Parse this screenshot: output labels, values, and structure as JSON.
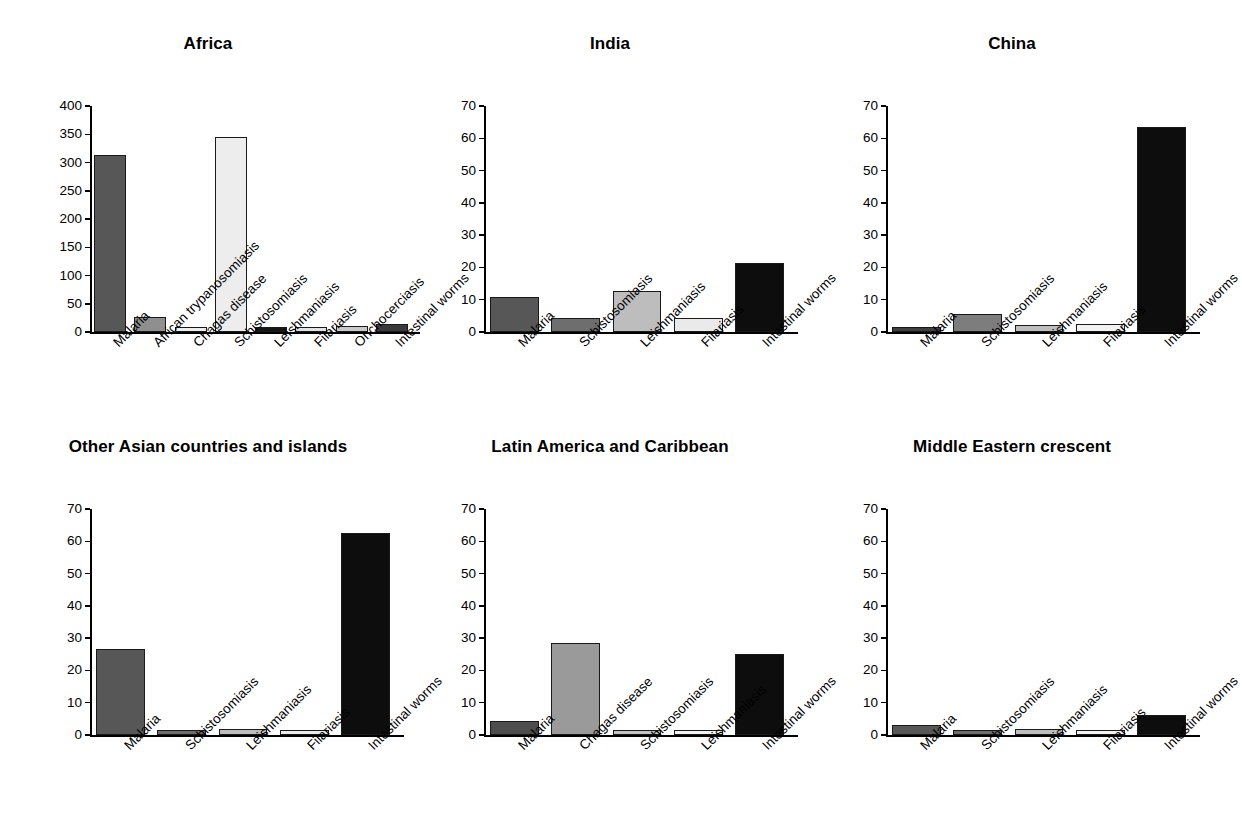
{
  "figure": {
    "background": "#ffffff",
    "panel_count": 6,
    "layout": "2 rows x 3 columns"
  },
  "palette": {
    "malaria": "#575757",
    "african_trypanosomiasis": "#8f8f8f",
    "chagas_disease": "#9a9a9a",
    "schistosomiasis_light": "#ededed",
    "schistosomiasis_medium": "#6e6e6e",
    "leishmaniasis": "#bdbdbd",
    "filariasis": "#eaeaea",
    "onchocerciasis": "#c9c9c9",
    "intestinal_worms": "#0d0d0d",
    "axis": "#000000",
    "bar_outline": "#1a1a1a"
  },
  "chart_data": [
    {
      "type": "bar",
      "title": "Africa",
      "xlabel": "",
      "ylabel": "",
      "ylim": [
        0,
        400
      ],
      "yticks": [
        0,
        50,
        100,
        150,
        200,
        250,
        300,
        350,
        400
      ],
      "grid": false,
      "legend": "none",
      "categories": [
        "Malaria",
        "African trypanosomiasis",
        "Chagas disease",
        "Schistosomiasis",
        "Leishmaniasis",
        "Filariasis",
        "Onchocerciasis",
        "Intestinal worms"
      ],
      "values": [
        313,
        26,
        6,
        346,
        9,
        9,
        11,
        15
      ],
      "colors": [
        "#575757",
        "#8f8f8f",
        "#ededed",
        "#ededed",
        "#161616",
        "#e2e2e2",
        "#c9c9c9",
        "#3a3a3a"
      ]
    },
    {
      "type": "bar",
      "title": "India",
      "xlabel": "",
      "ylabel": "",
      "ylim": [
        0,
        70
      ],
      "yticks": [
        0,
        10,
        20,
        30,
        40,
        50,
        60,
        70
      ],
      "grid": false,
      "legend": "none",
      "categories": [
        "Malaria",
        "Schistosomiasis",
        "Leishmaniasis",
        "Filariasis",
        "Intestinal worms"
      ],
      "values": [
        11.0,
        4.3,
        12.7,
        4.3,
        21.3
      ],
      "colors": [
        "#575757",
        "#6e6e6e",
        "#bdbdbd",
        "#eaeaea",
        "#0d0d0d"
      ]
    },
    {
      "type": "bar",
      "title": "China",
      "xlabel": "",
      "ylabel": "",
      "ylim": [
        0,
        70
      ],
      "yticks": [
        0,
        10,
        20,
        30,
        40,
        50,
        60,
        70
      ],
      "grid": false,
      "legend": "none",
      "categories": [
        "Malaria",
        "Schistosomiasis",
        "Leishmaniasis",
        "Filariasis",
        "Intestinal worms"
      ],
      "values": [
        1.3,
        5.5,
        2.2,
        2.5,
        63.5
      ],
      "colors": [
        "#3f3f3f",
        "#7d7d7d",
        "#bdbdbd",
        "#f2f2f2",
        "#0d0d0d"
      ]
    },
    {
      "type": "bar",
      "title": "Other Asian countries and islands",
      "xlabel": "",
      "ylabel": "",
      "ylim": [
        0,
        70
      ],
      "yticks": [
        0,
        10,
        20,
        30,
        40,
        50,
        60,
        70
      ],
      "grid": false,
      "legend": "none",
      "categories": [
        "Malaria",
        "Schistosomiasis",
        "Leishmaniasis",
        "Filariasis",
        "Intestinal worms"
      ],
      "values": [
        26.5,
        1.2,
        2.0,
        1.6,
        62.5
      ],
      "colors": [
        "#575757",
        "#6e6e6e",
        "#bdbdbd",
        "#eaeaea",
        "#0d0d0d"
      ]
    },
    {
      "type": "bar",
      "title": "Latin America and Caribbean",
      "xlabel": "",
      "ylabel": "",
      "ylim": [
        0,
        70
      ],
      "yticks": [
        0,
        10,
        20,
        30,
        40,
        50,
        60,
        70
      ],
      "grid": false,
      "legend": "none",
      "categories": [
        "Malaria",
        "Chagas disease",
        "Schistosomiasis",
        "Leishmaniasis",
        "Intestinal worms"
      ],
      "values": [
        4.3,
        28.5,
        1.4,
        0.9,
        25.0
      ],
      "colors": [
        "#4d4d4d",
        "#9a9a9a",
        "#c4c4c4",
        "#f2f2f2",
        "#0d0d0d"
      ]
    },
    {
      "type": "bar",
      "title": "Middle Eastern crescent",
      "xlabel": "",
      "ylabel": "",
      "ylim": [
        0,
        70
      ],
      "yticks": [
        0,
        10,
        20,
        30,
        40,
        50,
        60,
        70
      ],
      "grid": false,
      "legend": "none",
      "categories": [
        "Malaria",
        "Schistosomiasis",
        "Leishmaniasis",
        "Filariasis",
        "Intestinal worms"
      ],
      "values": [
        3.0,
        1.6,
        2.0,
        1.0,
        6.1
      ],
      "colors": [
        "#575757",
        "#6e6e6e",
        "#bdbdbd",
        "#f2f2f2",
        "#0d0d0d"
      ]
    }
  ]
}
